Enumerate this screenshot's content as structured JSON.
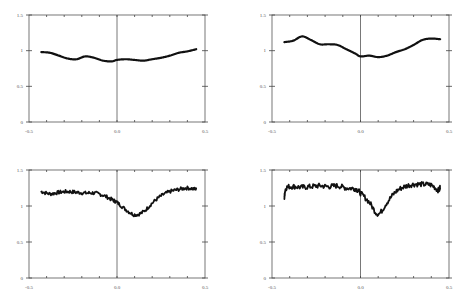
{
  "chart_data": [
    {
      "type": "line",
      "title": "",
      "xlabel": "",
      "ylabel": "",
      "xlim": [
        -0.5,
        0.5
      ],
      "ylim": [
        0,
        1.5
      ],
      "x_tick_labels": [
        "-0.5",
        "0.0",
        "0.5"
      ],
      "y_tick_labels": [
        "0",
        "0.5",
        "1",
        "1.5"
      ],
      "grid": false,
      "line_width": 2.2,
      "series": [
        {
          "name": "profile-1",
          "x": [
            -0.43,
            -0.38,
            -0.33,
            -0.28,
            -0.23,
            -0.18,
            -0.13,
            -0.08,
            -0.03,
            0.0,
            0.05,
            0.1,
            0.15,
            0.2,
            0.25,
            0.3,
            0.35,
            0.4,
            0.45
          ],
          "y": [
            0.98,
            0.97,
            0.93,
            0.89,
            0.88,
            0.92,
            0.9,
            0.86,
            0.85,
            0.87,
            0.88,
            0.87,
            0.86,
            0.88,
            0.9,
            0.93,
            0.97,
            0.99,
            1.02
          ]
        }
      ]
    },
    {
      "type": "line",
      "title": "",
      "xlabel": "",
      "ylabel": "",
      "xlim": [
        -0.5,
        0.5
      ],
      "ylim": [
        0,
        1.5
      ],
      "x_tick_labels": [
        "-0.5",
        "0.0",
        "0.5"
      ],
      "y_tick_labels": [
        "0",
        "0.5",
        "1",
        "1.5"
      ],
      "grid": false,
      "line_width": 2.2,
      "series": [
        {
          "name": "profile-2",
          "x": [
            -0.43,
            -0.38,
            -0.33,
            -0.28,
            -0.23,
            -0.18,
            -0.13,
            -0.08,
            -0.03,
            0.0,
            0.05,
            0.1,
            0.15,
            0.2,
            0.25,
            0.3,
            0.35,
            0.4,
            0.45
          ],
          "y": [
            1.12,
            1.14,
            1.2,
            1.15,
            1.09,
            1.09,
            1.08,
            1.02,
            0.96,
            0.92,
            0.93,
            0.91,
            0.93,
            0.98,
            1.02,
            1.08,
            1.15,
            1.17,
            1.16
          ]
        }
      ]
    },
    {
      "type": "line",
      "title": "",
      "xlabel": "",
      "ylabel": "",
      "xlim": [
        -0.5,
        0.5
      ],
      "ylim": [
        0,
        1.5
      ],
      "x_tick_labels": [
        "-0.5",
        "0.0",
        "0.5"
      ],
      "y_tick_labels": [
        "0",
        "0.5",
        "1",
        "1.5"
      ],
      "grid": false,
      "line_width": 1.8,
      "noise": 0.025,
      "series": [
        {
          "name": "profile-3",
          "x": [
            -0.43,
            -0.38,
            -0.33,
            -0.28,
            -0.23,
            -0.18,
            -0.13,
            -0.08,
            -0.03,
            0.0,
            0.05,
            0.1,
            0.15,
            0.2,
            0.25,
            0.3,
            0.35,
            0.4,
            0.45
          ],
          "y": [
            1.2,
            1.17,
            1.19,
            1.2,
            1.19,
            1.18,
            1.18,
            1.15,
            1.09,
            1.05,
            0.95,
            0.88,
            0.92,
            1.04,
            1.14,
            1.2,
            1.23,
            1.25,
            1.23
          ]
        }
      ]
    },
    {
      "type": "line",
      "title": "",
      "xlabel": "",
      "ylabel": "",
      "xlim": [
        -0.5,
        0.5
      ],
      "ylim": [
        0,
        1.5
      ],
      "x_tick_labels": [
        "-0.5",
        "0.0",
        "0.5"
      ],
      "y_tick_labels": [
        "0",
        "0.5",
        "1",
        "1.5"
      ],
      "grid": false,
      "line_width": 1.8,
      "noise": 0.035,
      "series": [
        {
          "name": "profile-4",
          "x": [
            -0.43,
            -0.42,
            -0.38,
            -0.33,
            -0.28,
            -0.23,
            -0.18,
            -0.13,
            -0.08,
            -0.03,
            0.0,
            0.05,
            0.1,
            0.15,
            0.2,
            0.25,
            0.3,
            0.35,
            0.4,
            0.44,
            0.45
          ],
          "y": [
            1.12,
            1.25,
            1.27,
            1.26,
            1.27,
            1.28,
            1.27,
            1.28,
            1.25,
            1.24,
            1.18,
            1.05,
            0.89,
            1.05,
            1.2,
            1.27,
            1.3,
            1.3,
            1.29,
            1.22,
            1.27
          ]
        }
      ]
    }
  ],
  "layout": {
    "panels": [
      {
        "left": 29,
        "right": 205,
        "top": 15,
        "bottom": 122
      },
      {
        "left": 272,
        "right": 449,
        "top": 15,
        "bottom": 122
      },
      {
        "left": 29,
        "right": 205,
        "top": 170,
        "bottom": 278
      },
      {
        "left": 272,
        "right": 449,
        "top": 170,
        "bottom": 278
      }
    ]
  }
}
